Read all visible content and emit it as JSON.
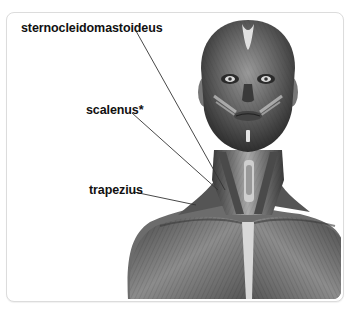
{
  "figure": {
    "labels": [
      {
        "id": "sternocleidomastoideus",
        "text": "sternocleidomastoideus"
      },
      {
        "id": "scalenus",
        "text": "scalenus*"
      },
      {
        "id": "trapezius",
        "text": "trapezius"
      }
    ],
    "colors": {
      "frame_border": "#dcdcdc",
      "leader_line": "#333333",
      "label_text": "#111111"
    }
  }
}
